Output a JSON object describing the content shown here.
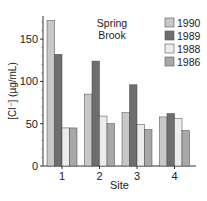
{
  "chart_data": {
    "type": "bar",
    "title_lines": [
      "Spring",
      "Brook"
    ],
    "xlabel": "Site",
    "ylabel": "[Cl⁻] (µg/mL)",
    "categories": [
      "1",
      "2",
      "3",
      "4"
    ],
    "series": [
      {
        "name": "1990",
        "color": "#c8c8c8",
        "values": [
          172,
          85,
          63,
          58
        ]
      },
      {
        "name": "1989",
        "color": "#6e6e6e",
        "values": [
          132,
          124,
          96,
          62
        ]
      },
      {
        "name": "1988",
        "color": "#ececec",
        "values": [
          45,
          59,
          49,
          56
        ]
      },
      {
        "name": "1986",
        "color": "#a8a8a8",
        "values": [
          45,
          50,
          43,
          42
        ]
      }
    ],
    "ylim": [
      0,
      175
    ],
    "yticks": [
      0,
      50,
      100,
      150
    ],
    "grid": false,
    "legend_position": "upper right"
  }
}
